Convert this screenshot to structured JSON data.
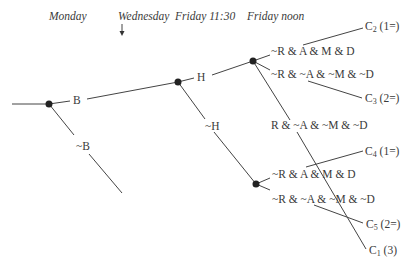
{
  "timeline": {
    "monday": "Monday",
    "wednesday": "Wednesday",
    "friday_1130": "Friday 11:30",
    "friday_noon": "Friday noon"
  },
  "branches": {
    "b": "B",
    "not_b": "~B",
    "h": "H",
    "not_h": "~H",
    "upper_good": "~R & A & M & D",
    "upper_bad": "~R & ~A & ~M & ~D",
    "revealed": "R & ~A & ~M & ~D",
    "lower_good": "~R & A & M & D",
    "lower_bad": "~R & ~A & ~M & ~D"
  },
  "outcomes": [
    {
      "id": "C",
      "sub": "2",
      "rank": "(1=)"
    },
    {
      "id": "C",
      "sub": "3",
      "rank": "(2=)"
    },
    {
      "id": "C",
      "sub": "4",
      "rank": "(1=)"
    },
    {
      "id": "C",
      "sub": "5",
      "rank": "(2=)"
    },
    {
      "id": "C",
      "sub": "1",
      "rank": "(3)"
    }
  ],
  "colors": {
    "line": "#444444",
    "node": "#222222",
    "text": "#3a3a3a"
  }
}
